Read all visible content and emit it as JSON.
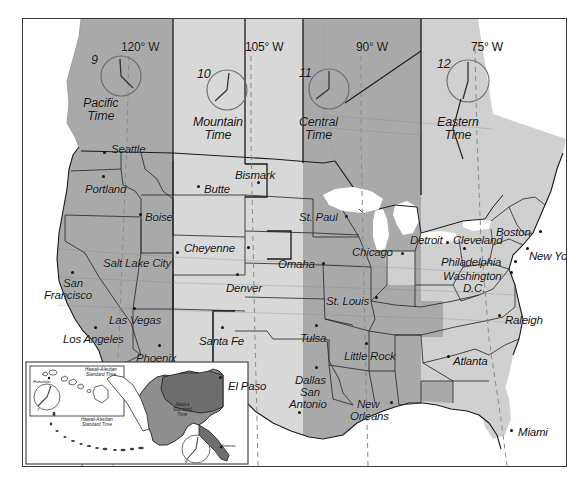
{
  "map": {
    "title": "United States Time Zones Map",
    "frame": {
      "border_color": "#3a3a3a"
    },
    "colors": {
      "pacific": "#a9a9a9",
      "mountain": "#d8d8d8",
      "central": "#a9a9a9",
      "eastern": "#d0d0d0",
      "water": "#ffffff",
      "outline": "#1a1a1a",
      "clock": "#6a6a6a",
      "dashed_meridian": "#8a8a8a"
    },
    "longitude_labels": [
      {
        "text": "120° W",
        "x": 98,
        "y": 22
      },
      {
        "text": "105° W",
        "x": 222,
        "y": 22
      },
      {
        "text": "90° W",
        "x": 333,
        "y": 22
      },
      {
        "text": "75° W",
        "x": 448,
        "y": 22
      }
    ],
    "time_zones": [
      {
        "name": "Pacific Time",
        "label_line1": "Pacific",
        "label_line2": "Time",
        "clock_hour": "9",
        "x": 60,
        "y": 78,
        "clock_cx": 98,
        "clock_cy": 57,
        "clock_r": 20
      },
      {
        "name": "Mountain Time",
        "label_line1": "Mountain",
        "label_line2": "Time",
        "clock_hour": "10",
        "x": 170,
        "y": 97,
        "clock_cx": 204,
        "clock_cy": 71,
        "clock_r": 20
      },
      {
        "name": "Central Time",
        "label_line1": "Central",
        "label_line2": "Time",
        "clock_hour": "11",
        "x": 276,
        "y": 97,
        "clock_cx": 306,
        "clock_cy": 70,
        "clock_r": 20
      },
      {
        "name": "Eastern Time",
        "label_line1": "Eastern",
        "label_line2": "Time",
        "clock_hour": "12",
        "x": 414,
        "y": 97,
        "clock_cx": 445,
        "clock_cy": 62,
        "clock_r": 21
      }
    ],
    "cities": [
      {
        "name": "Seattle",
        "lx": 88,
        "ly": 125,
        "dx": 80,
        "dy": 132,
        "align": "left"
      },
      {
        "name": "Portland",
        "lx": 62,
        "ly": 165,
        "dx": 79,
        "dy": 156,
        "align": "left"
      },
      {
        "name": "Butte",
        "lx": 181,
        "ly": 165,
        "dx": 174,
        "dy": 166,
        "align": "left"
      },
      {
        "name": "Boise",
        "lx": 122,
        "ly": 193,
        "dx": 116,
        "dy": 194,
        "align": "left"
      },
      {
        "name": "Bismark",
        "lx": 212,
        "ly": 151,
        "dx": 234,
        "dy": 162,
        "align": "left"
      },
      {
        "name": "St. Paul",
        "lx": 276,
        "ly": 193,
        "dx": 322,
        "dy": 196,
        "align": "left"
      },
      {
        "name": "Cheyenne",
        "lx": 161,
        "ly": 224,
        "dx": 224,
        "dy": 227,
        "align": "left"
      },
      {
        "name": "Salt Lake City",
        "lx": 80,
        "ly": 239,
        "dx": 153,
        "dy": 232,
        "align": "left"
      },
      {
        "name": "Omaha",
        "lx": 255,
        "ly": 240,
        "dx": 299,
        "dy": 243,
        "align": "left"
      },
      {
        "name": "Chicago",
        "lx": 329,
        "ly": 228,
        "dx": 378,
        "dy": 233,
        "align": "left"
      },
      {
        "name": "Detroit",
        "lx": 387,
        "ly": 216,
        "dx": 423,
        "dy": 222,
        "align": "left"
      },
      {
        "name": "Cleveland",
        "lx": 430,
        "ly": 216,
        "dx": 440,
        "dy": 228,
        "align": "left"
      },
      {
        "name": "Boston",
        "lx": 473,
        "ly": 208,
        "dx": 516,
        "dy": 211,
        "align": "left"
      },
      {
        "name": "New York",
        "lx": 506,
        "ly": 232,
        "dx": 503,
        "dy": 228,
        "align": "left"
      },
      {
        "name": "Philadelphia",
        "lx": 418,
        "ly": 238,
        "dx": 491,
        "dy": 241,
        "align": "left"
      },
      {
        "name": "Washington",
        "lx": 420,
        "ly": 252,
        "dx": 487,
        "dy": 252,
        "align": "left"
      },
      {
        "name": "D.C.",
        "lx": 440,
        "ly": 264,
        "dx": -99,
        "dy": -99,
        "align": "left"
      },
      {
        "name": "Denver",
        "lx": 203,
        "ly": 264,
        "dx": 213,
        "dy": 254,
        "align": "left"
      },
      {
        "name": "San",
        "lx": 40,
        "ly": 259,
        "dx": 48,
        "dy": 252,
        "align": "left"
      },
      {
        "name": "Francisco",
        "lx": 21,
        "ly": 271,
        "dx": -99,
        "dy": -99,
        "align": "left"
      },
      {
        "name": "St. Louis",
        "lx": 303,
        "ly": 277,
        "dx": 352,
        "dy": 277,
        "align": "left"
      },
      {
        "name": "Las Vegas",
        "lx": 86,
        "ly": 296,
        "dx": 110,
        "dy": 288,
        "align": "left"
      },
      {
        "name": "Los Angeles",
        "lx": 40,
        "ly": 315,
        "dx": 71,
        "dy": 307,
        "align": "left"
      },
      {
        "name": "Santa Fe",
        "lx": 176,
        "ly": 317,
        "dx": 198,
        "dy": 307,
        "align": "left"
      },
      {
        "name": "Tulsa",
        "lx": 277,
        "ly": 314,
        "dx": 292,
        "dy": 305,
        "align": "left"
      },
      {
        "name": "Raleigh",
        "lx": 482,
        "ly": 296,
        "dx": 475,
        "dy": 295,
        "align": "left"
      },
      {
        "name": "Phoenix",
        "lx": 113,
        "ly": 334,
        "dx": 135,
        "dy": 325,
        "align": "left"
      },
      {
        "name": "Little Rock",
        "lx": 321,
        "ly": 332,
        "dx": 342,
        "dy": 323,
        "align": "left"
      },
      {
        "name": "Atlanta",
        "lx": 430,
        "ly": 337,
        "dx": 424,
        "dy": 336,
        "align": "left"
      },
      {
        "name": "El Paso",
        "lx": 205,
        "ly": 362,
        "dx": 196,
        "dy": 357,
        "align": "left"
      },
      {
        "name": "Dallas",
        "lx": 272,
        "ly": 356,
        "dx": 292,
        "dy": 347,
        "align": "left"
      },
      {
        "name": "San",
        "lx": 277,
        "ly": 368,
        "dx": -99,
        "dy": -99,
        "align": "left"
      },
      {
        "name": "Antonio",
        "lx": 266,
        "ly": 380,
        "dx": 275,
        "dy": 392,
        "align": "left"
      },
      {
        "name": "New",
        "lx": 334,
        "ly": 380,
        "dx": 367,
        "dy": 382,
        "align": "left"
      },
      {
        "name": "Orleans",
        "lx": 327,
        "ly": 392,
        "dx": -99,
        "dy": -99,
        "align": "left"
      },
      {
        "name": "Miami",
        "lx": 495,
        "ly": 408,
        "dx": 487,
        "dy": 410,
        "align": "left"
      }
    ],
    "inset": {
      "hawaii_box_label_line1": "Hawaii-Aleutian",
      "hawaii_box_label_line2": "Standard Time",
      "aleutian_label_line1": "Hawaii-Aleutian",
      "aleutian_label_line2": "Standard Time",
      "alaska_label_line1": "Alaska",
      "alaska_label_line2": "Standard",
      "alaska_label_line3": "Time",
      "honolulu": "Honolulu",
      "juneau": "Juneau",
      "hawaii_clock_hour": "7",
      "alaska_clock_hour": "8"
    }
  }
}
